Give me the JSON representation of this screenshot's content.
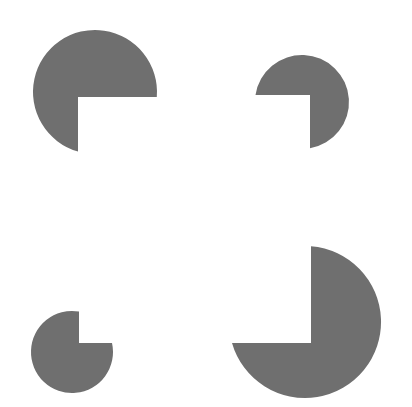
{
  "figure": {
    "type": "kanizsa-square-illusion",
    "width": 412,
    "height": 407,
    "background": "#ffffff",
    "fill": "#6f6f6f",
    "inducers": [
      {
        "name": "inducer-top-left",
        "cx": 95,
        "cy": 92,
        "r": 62,
        "notch": {
          "x": 78,
          "y": 97
        },
        "missing_quadrant": "bottom-right",
        "path": "M78,97 L156.8,97 A62,62 0 1 0 78,151.6 Z"
      },
      {
        "name": "inducer-top-right",
        "cx": 302,
        "cy": 102,
        "r": 47,
        "notch": {
          "x": 310,
          "y": 95
        },
        "missing_quadrant": "bottom-left",
        "path": "M310,95 L255.5,95 A47,47 0 1 1 310,148.3 Z"
      },
      {
        "name": "inducer-bottom-left",
        "cx": 72,
        "cy": 352,
        "r": 41,
        "notch": {
          "x": 79,
          "y": 343
        },
        "missing_quadrant": "top-right",
        "path": "M79,343 L79,311.6 A41,41 0 1 0 112,343 Z"
      },
      {
        "name": "inducer-bottom-right",
        "cx": 305,
        "cy": 322,
        "r": 76,
        "notch": {
          "x": 311,
          "y": 343
        },
        "missing_quadrant": "top-left",
        "path": "M311,343 L311,246.2 A76,76 0 1 1 232,343 Z"
      }
    ],
    "illusory_square": {
      "x1": 78,
      "y1": 96,
      "x2": 311,
      "y2": 343
    }
  }
}
